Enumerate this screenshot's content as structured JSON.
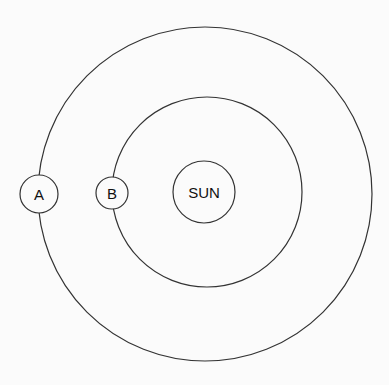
{
  "diagram": {
    "sun": {
      "label": "SUN"
    },
    "planets": [
      {
        "label": "A",
        "orbit": "outer"
      },
      {
        "label": "B",
        "orbit": "inner"
      }
    ],
    "colors": {
      "stroke": "#333333",
      "background": "#fbfbfb"
    }
  }
}
